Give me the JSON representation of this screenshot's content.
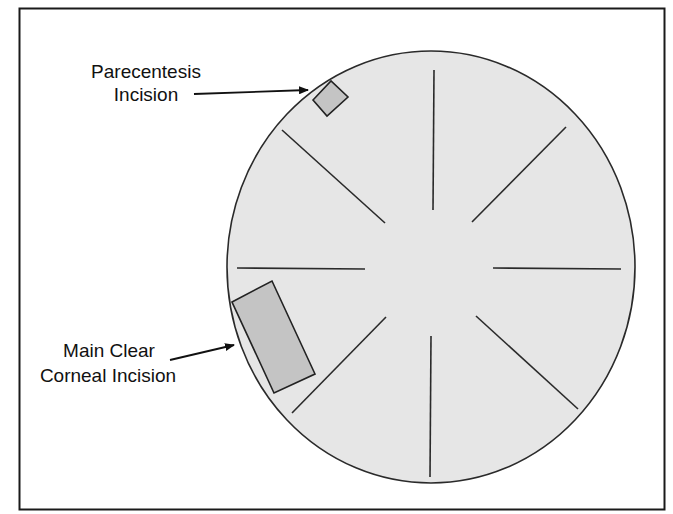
{
  "diagram": {
    "colors": {
      "frame": "#1a1a1a",
      "cornea_fill": "#e6e6e6",
      "cornea_stroke": "#2a2a2a",
      "spoke": "#2a2a2a",
      "incision_fill": "#c4c4c4",
      "incision_stroke": "#222222",
      "text": "#111111",
      "background": "#ffffff"
    },
    "cornea": {
      "cx": 431,
      "cy": 267,
      "rx": 204,
      "ry": 216
    },
    "spokes": [
      {
        "name": "spoke-top",
        "x1": 434,
        "y1": 70,
        "x2": 433,
        "y2": 210
      },
      {
        "name": "spoke-upper-right",
        "x1": 566,
        "y1": 127,
        "x2": 472,
        "y2": 222
      },
      {
        "name": "spoke-right",
        "x1": 493,
        "y1": 268,
        "x2": 621,
        "y2": 269
      },
      {
        "name": "spoke-lower-right",
        "x1": 476,
        "y1": 316,
        "x2": 578,
        "y2": 409
      },
      {
        "name": "spoke-bottom",
        "x1": 431,
        "y1": 336,
        "x2": 430,
        "y2": 477
      },
      {
        "name": "spoke-lower-left",
        "x1": 386,
        "y1": 317,
        "x2": 292,
        "y2": 413
      },
      {
        "name": "spoke-left",
        "x1": 237,
        "y1": 268,
        "x2": 365,
        "y2": 269
      },
      {
        "name": "spoke-upper-left",
        "x1": 282,
        "y1": 130,
        "x2": 385,
        "y2": 223
      }
    ],
    "incisions": [
      {
        "name": "paracentesis-incision",
        "points": "313,100 331,81 348,97 327,116"
      },
      {
        "name": "main-clear-corneal-incision",
        "points": "232,302 272,281 315,374 274,393"
      }
    ],
    "labels": {
      "paracentesis": {
        "line1": "Parecentesis",
        "line2": "Incision"
      },
      "main": {
        "line1": "Main Clear",
        "line2": "Corneal Incision"
      }
    },
    "arrows": {
      "paracentesis": {
        "x1": 194,
        "y1": 94,
        "x2": 308,
        "y2": 90
      },
      "main": {
        "x1": 170,
        "y1": 360,
        "x2": 234,
        "y2": 345
      }
    }
  }
}
